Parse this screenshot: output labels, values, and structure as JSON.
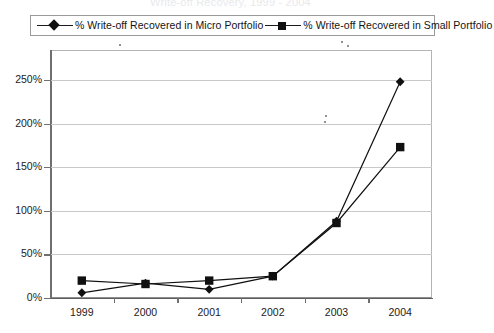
{
  "chart_data": {
    "type": "line",
    "title": "",
    "xlabel": "",
    "ylabel": "",
    "categories": [
      "1999",
      "2000",
      "2001",
      "2002",
      "2003",
      "2004"
    ],
    "ylim": [
      0,
      250
    ],
    "ytick_labels": [
      "0%",
      "50%",
      "100%",
      "150%",
      "200%",
      "250%"
    ],
    "ytick_values": [
      0,
      50,
      100,
      150,
      200,
      250
    ],
    "yaxis_unit": "%",
    "grid": "horizontal",
    "legend_position": "top",
    "series": [
      {
        "name": "% Write-off Recovered in Micro Portfolio",
        "marker": "diamond",
        "color": "#101010",
        "values": [
          6,
          17,
          10,
          25,
          88,
          248
        ]
      },
      {
        "name": "% Write-off Recovered in Small Portfolio",
        "marker": "square",
        "color": "#101010",
        "values": [
          20,
          16,
          20,
          25,
          86,
          173
        ]
      }
    ]
  },
  "legend": {
    "items": [
      {
        "label": "% Write-off Recovered in Micro Portfolio",
        "marker": "diamond"
      },
      {
        "label": "% Write-off Recovered in Small Portfolio",
        "marker": "square"
      }
    ]
  },
  "title_fragment": "Write-off Recovery, 1999 - 2004"
}
